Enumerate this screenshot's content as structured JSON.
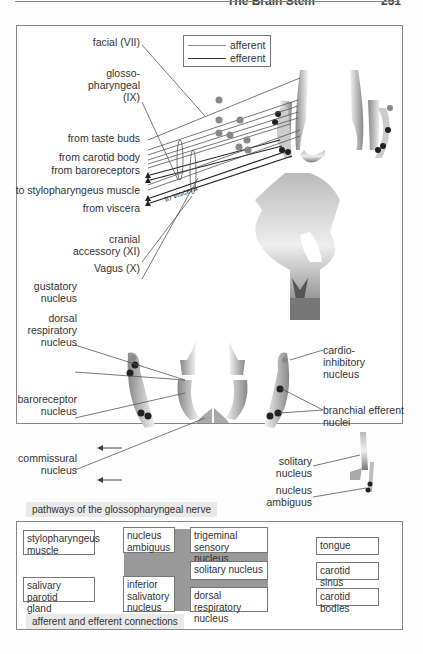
{
  "header": {
    "title": "The Brain Stem",
    "page": "251"
  },
  "legend": {
    "afferent": "afferent",
    "efferent": "efferent",
    "afferent_color": "#888888",
    "efferent_color": "#333333"
  },
  "top_labels": {
    "facial": "facial (VII)",
    "glosso1": "glosso-",
    "glosso2": "pharyngeal",
    "glosso3": "(IX)",
    "taste": "from taste buds",
    "carotid_body": "from carotid body",
    "baroreceptors": "from baroreceptors",
    "stylo": "to stylopharyngeus muscle",
    "viscera": "from viscera",
    "to_viscera": "to viscera",
    "cranial1": "cranial",
    "cranial2": "accessory (XI)",
    "vagus": "Vagus (X)"
  },
  "section_labels": {
    "gustatory1": "gustatory",
    "gustatory2": "nucleus",
    "dorsal1": "dorsal",
    "dorsal2": "respiratory",
    "dorsal3": "nucleus",
    "baro1": "baroreceptor",
    "baro2": "nucleus",
    "comm1": "commissural",
    "comm2": "nucleus",
    "cardio1": "cardio-",
    "cardio2": "inhibitory",
    "cardio3": "nucleus",
    "branchial1": "branchial efferent",
    "branchial2": "nuclei",
    "solitary1": "solitary",
    "solitary2": "nucleus",
    "ambiguus1": "nucleus",
    "ambiguus2": "ambiguus"
  },
  "captions": {
    "pathways": "pathways of the glossopharyngeal nerve",
    "connections": "afferent and efferent connections"
  },
  "connections": {
    "targets": [
      {
        "l1": "stylopharyngeus",
        "l2": "muscle"
      },
      {
        "l1": "salivary parotid",
        "l2": "gland"
      }
    ],
    "efferent_nuclei": [
      {
        "l1": "nucleus",
        "l2": "ambiguus"
      },
      {
        "l1": "inferior",
        "l2": "salivatory",
        "l3": "nucleus"
      }
    ],
    "afferent_nuclei": [
      {
        "l1": "trigeminal sensory",
        "l2": "nucleus"
      },
      {
        "l1": "solitary  nucleus"
      },
      {
        "l1": "dorsal respiratory",
        "l2": "nucleus"
      }
    ],
    "sources": [
      {
        "l1": "tongue"
      },
      {
        "l1": "carotid sinus"
      },
      {
        "l1": "carotid bodies"
      }
    ]
  }
}
